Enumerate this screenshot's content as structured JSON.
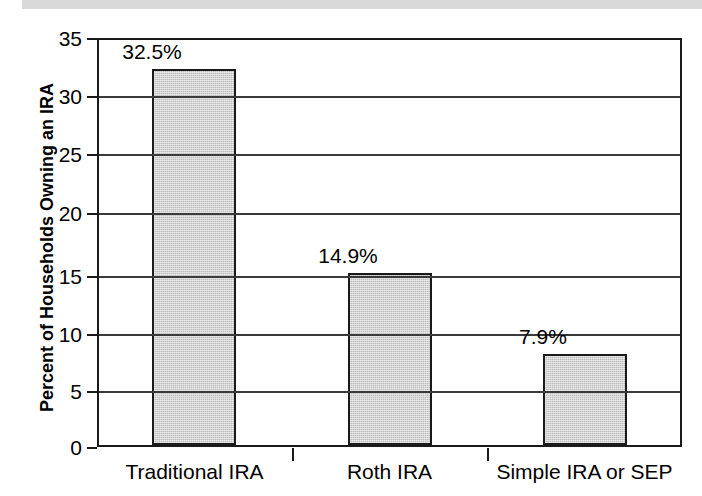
{
  "figure": {
    "top_band_color": "#d9d9d9"
  },
  "chart_data": {
    "type": "bar",
    "title": "",
    "xlabel": "",
    "ylabel": "Percent of Households Owning an IRA",
    "categories": [
      "Traditional IRA",
      "Roth IRA",
      "Simple IRA or SEP"
    ],
    "values": [
      32.5,
      14.9,
      7.9
    ],
    "data_labels": [
      "32.5%",
      "14.9%",
      "7.9%"
    ],
    "ylim": [
      0,
      35
    ],
    "yticks": [
      0,
      5,
      10,
      15,
      20,
      25,
      30,
      35
    ],
    "ytick_labels": [
      "0",
      "5",
      "10",
      "15",
      "20",
      "25",
      "30",
      "35"
    ],
    "grid": true,
    "legend": "none",
    "bar_fill_color": "#bfbfbf",
    "bar_edge_color": "#1a1a1a",
    "axis_color": "#1a1a1a"
  }
}
